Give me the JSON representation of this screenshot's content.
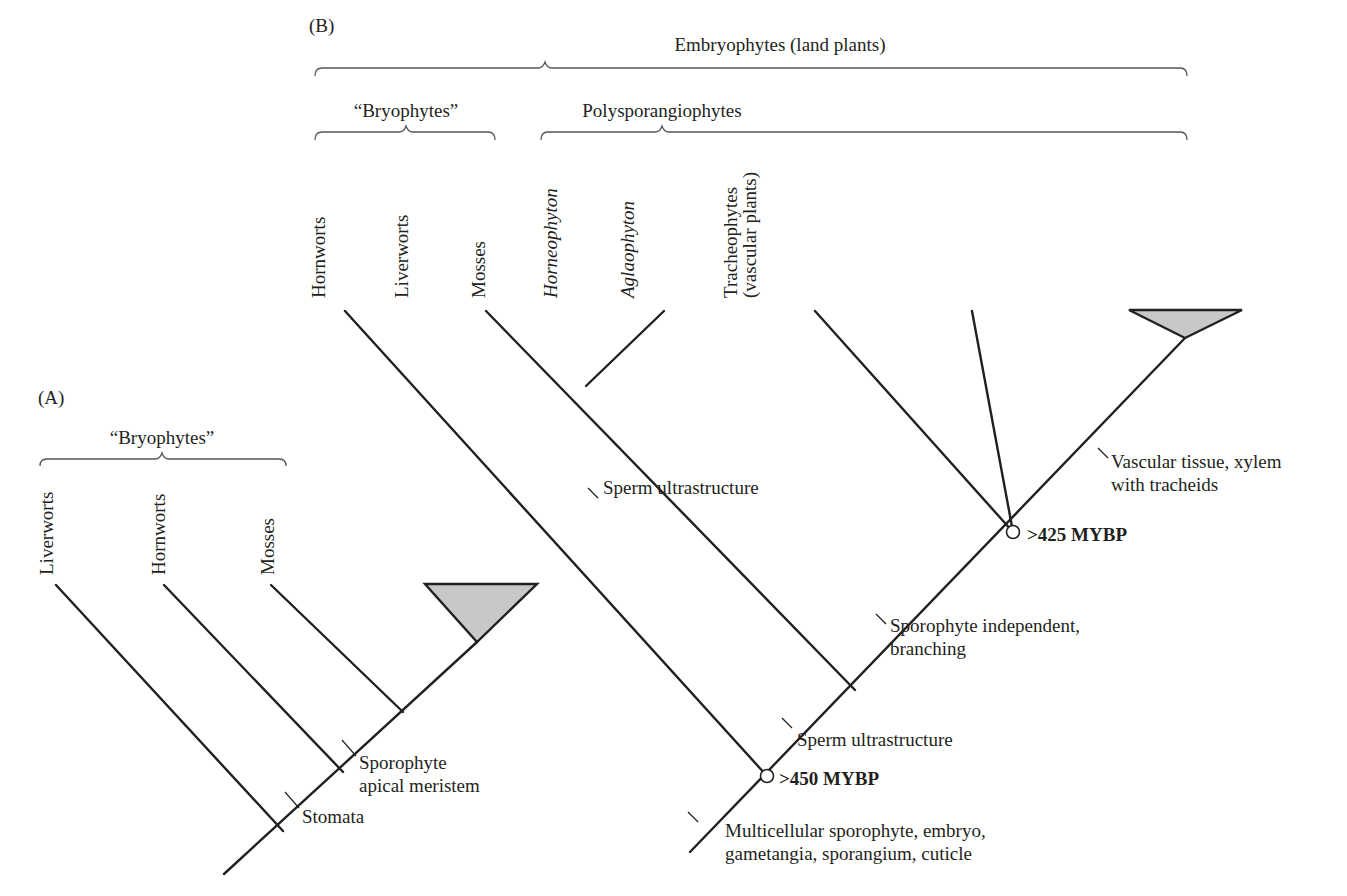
{
  "panel_a": {
    "label": "(A)",
    "group_label": "“Bryophytes”",
    "taxa": [
      "Liverworts",
      "Hornworts",
      "Mosses"
    ],
    "characters": [
      "Sporophyte",
      "apical meristem",
      "Stomata"
    ]
  },
  "panel_b": {
    "label": "(B)",
    "top_group_label": "Embryophytes (land plants)",
    "group_bryophytes": "“Bryophytes”",
    "group_polysporangiophytes": "Polysporangiophytes",
    "taxa": [
      "Hornworts",
      "Liverworts",
      "Mosses",
      "Horneophyton",
      "Aglaophyton",
      "Tracheophytes",
      "(vascular plants)"
    ],
    "characters": {
      "sperm_liverworts_mosses": "Sperm ultrastructure",
      "vascular_1": "Vascular tissue, xylem",
      "vascular_2": "with tracheids",
      "sporophyte_1": "Sporophyte independent,",
      "sporophyte_2": "branching",
      "sperm_main": "Sperm ultrastructure",
      "multicellular_1": "Multicellular sporophyte, embryo,",
      "multicellular_2": "gametangia, sporangium, cuticle"
    },
    "dates": {
      "node_upper": ">425 MYBP",
      "node_lower": ">450 MYBP"
    }
  }
}
